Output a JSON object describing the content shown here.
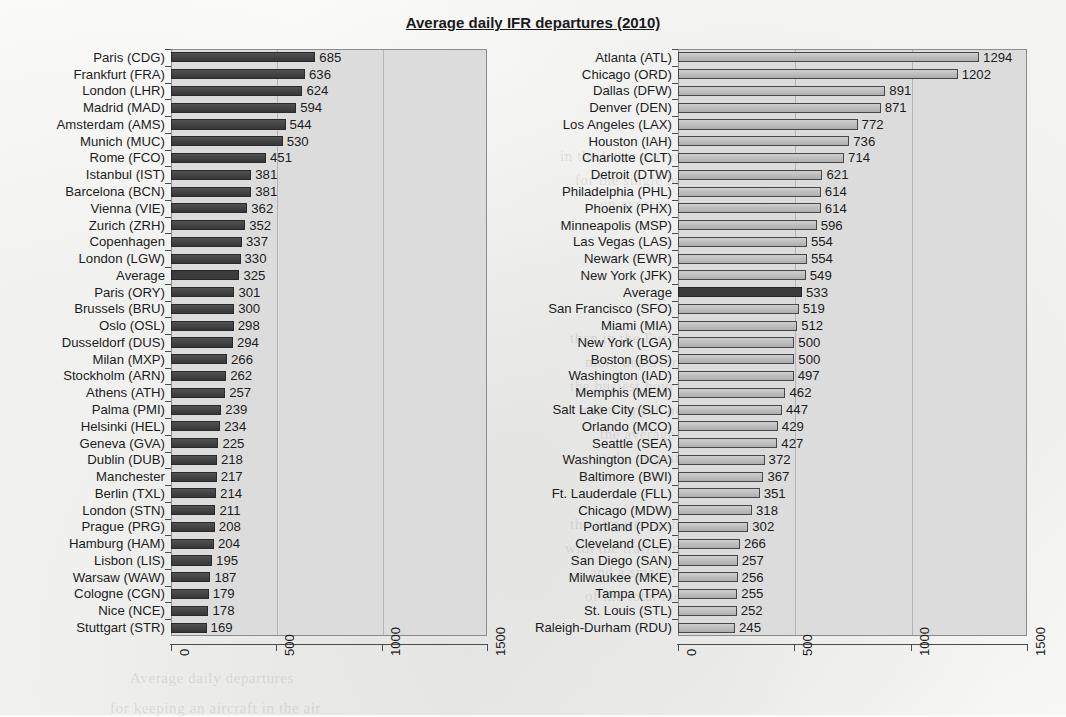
{
  "title": "Average daily IFR departures (2010)",
  "chart_data": [
    {
      "type": "bar",
      "orientation": "horizontal",
      "panel": "europe",
      "title": "Average daily IFR departures (2010)",
      "xlabel": "",
      "ylabel": "",
      "xlim": [
        0,
        1500
      ],
      "xticks": [
        0,
        500,
        1000,
        1500
      ],
      "xtick_labels": [
        "0",
        "500",
        "1000",
        "1500"
      ],
      "grid": true,
      "grid_axis": "x",
      "bar_color": "#3e3e3e",
      "highlight_color": "#3b3b3b",
      "highlight_category": "Average",
      "categories": [
        "Paris (CDG)",
        "Frankfurt (FRA)",
        "London (LHR)",
        "Madrid (MAD)",
        "Amsterdam (AMS)",
        "Munich (MUC)",
        "Rome (FCO)",
        "Istanbul (IST)",
        "Barcelona (BCN)",
        "Vienna (VIE)",
        "Zurich (ZRH)",
        "Copenhagen",
        "London (LGW)",
        "Average",
        "Paris (ORY)",
        "Brussels (BRU)",
        "Oslo (OSL)",
        "Dusseldorf (DUS)",
        "Milan (MXP)",
        "Stockholm (ARN)",
        "Athens (ATH)",
        "Palma (PMI)",
        "Helsinki (HEL)",
        "Geneva (GVA)",
        "Dublin (DUB)",
        "Manchester",
        "Berlin (TXL)",
        "London (STN)",
        "Prague (PRG)",
        "Hamburg (HAM)",
        "Lisbon (LIS)",
        "Warsaw (WAW)",
        "Cologne (CGN)",
        "Nice (NCE)",
        "Stuttgart (STR)"
      ],
      "values": [
        685,
        636,
        624,
        594,
        544,
        530,
        451,
        381,
        381,
        362,
        352,
        337,
        330,
        325,
        301,
        300,
        298,
        294,
        266,
        262,
        257,
        239,
        234,
        225,
        218,
        217,
        214,
        211,
        208,
        204,
        195,
        187,
        179,
        178,
        169
      ]
    },
    {
      "type": "bar",
      "orientation": "horizontal",
      "panel": "usa",
      "title": "Average daily IFR departures (2010)",
      "xlabel": "",
      "ylabel": "",
      "xlim": [
        0,
        1500
      ],
      "xticks": [
        0,
        500,
        1000,
        1500
      ],
      "xtick_labels": [
        "0",
        "500",
        "1000",
        "1500"
      ],
      "grid": true,
      "grid_axis": "x",
      "bar_color": "#b9b9b9",
      "highlight_color": "#3b3b3b",
      "highlight_category": "Average",
      "categories": [
        "Atlanta (ATL)",
        "Chicago (ORD)",
        "Dallas (DFW)",
        "Denver (DEN)",
        "Los Angeles (LAX)",
        "Houston (IAH)",
        "Charlotte (CLT)",
        "Detroit (DTW)",
        "Philadelphia (PHL)",
        "Phoenix (PHX)",
        "Minneapolis (MSP)",
        "Las Vegas (LAS)",
        "Newark (EWR)",
        "New York (JFK)",
        "Average",
        "San Francisco (SFO)",
        "Miami (MIA)",
        "New York (LGA)",
        "Boston (BOS)",
        "Washington (IAD)",
        "Memphis (MEM)",
        "Salt Lake City (SLC)",
        "Orlando (MCO)",
        "Seattle (SEA)",
        "Washington (DCA)",
        "Baltimore (BWI)",
        "Ft. Lauderdale (FLL)",
        "Chicago (MDW)",
        "Portland (PDX)",
        "Cleveland (CLE)",
        "San Diego (SAN)",
        "Milwaukee (MKE)",
        "Tampa (TPA)",
        "St. Louis (STL)",
        "Raleigh-Durham (RDU)"
      ],
      "values": [
        1294,
        1202,
        891,
        871,
        772,
        736,
        714,
        621,
        614,
        614,
        596,
        554,
        554,
        549,
        533,
        519,
        512,
        500,
        500,
        497,
        462,
        447,
        429,
        427,
        372,
        367,
        351,
        318,
        302,
        266,
        257,
        256,
        255,
        252,
        245
      ]
    }
  ],
  "bleed_text": [
    {
      "text": "in the latter part of the decade, and",
      "x": 560,
      "y": 148
    },
    {
      "text": "for the single busiest hour",
      "x": 575,
      "y": 172
    },
    {
      "text": "on average",
      "x": 600,
      "y": 196
    },
    {
      "text": "than in the European system",
      "x": 570,
      "y": 330
    },
    {
      "text": "more departures per day",
      "x": 585,
      "y": 354
    },
    {
      "text": "the busiest hour is similar",
      "x": 570,
      "y": 378
    },
    {
      "text": "and the peak hour demand",
      "x": 580,
      "y": 402
    },
    {
      "text": "the average number",
      "x": 600,
      "y": 426
    },
    {
      "text": "at the largest hubs",
      "x": 595,
      "y": 450
    },
    {
      "text": "the airports in the network",
      "x": 570,
      "y": 516
    },
    {
      "text": "with the traffic in the system",
      "x": 565,
      "y": 540
    },
    {
      "text": "and a smaller fraction",
      "x": 590,
      "y": 564
    },
    {
      "text": "of the total movements",
      "x": 585,
      "y": 588
    },
    {
      "text": "Average daily departures",
      "x": 130,
      "y": 670
    },
    {
      "text": "for keeping an aircraft in the air",
      "x": 110,
      "y": 700
    }
  ]
}
